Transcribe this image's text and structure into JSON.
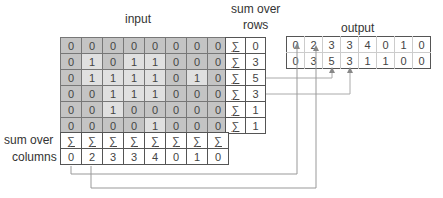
{
  "labels": {
    "input": "input",
    "sum_over_rows_line1": "sum over",
    "sum_over_rows_line2": "rows",
    "output": "output",
    "sum_over_columns_line1": "sum over",
    "sum_over_columns_line2": "columns"
  },
  "sigma_symbol": "∑",
  "input": {
    "rows": [
      [
        "0",
        "0",
        "0",
        "0",
        "0",
        "0",
        "0",
        "0"
      ],
      [
        "0",
        "1",
        "0",
        "1",
        "1",
        "0",
        "0",
        "0"
      ],
      [
        "0",
        "1",
        "1",
        "1",
        "1",
        "0",
        "1",
        "0"
      ],
      [
        "0",
        "0",
        "1",
        "1",
        "1",
        "0",
        "0",
        "0"
      ],
      [
        "0",
        "0",
        "1",
        "0",
        "0",
        "0",
        "0",
        "0"
      ],
      [
        "0",
        "0",
        "0",
        "0",
        "1",
        "0",
        "0",
        "0"
      ]
    ]
  },
  "row_sums": [
    "0",
    "3",
    "5",
    "3",
    "1",
    "1"
  ],
  "column_sums": [
    "0",
    "2",
    "3",
    "3",
    "4",
    "0",
    "1",
    "0"
  ],
  "output": {
    "rows": [
      [
        "0",
        "2",
        "3",
        "3",
        "4",
        "0",
        "1",
        "0"
      ],
      [
        "0",
        "3",
        "5",
        "3",
        "1",
        "1",
        "0",
        "0"
      ]
    ]
  },
  "colors": {
    "zero_cell": "#c4c4c4",
    "one_cell": "#e0e0e0",
    "connector_line": "#999999"
  }
}
